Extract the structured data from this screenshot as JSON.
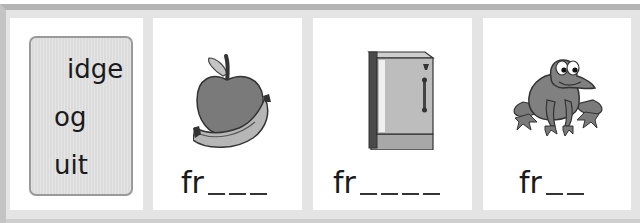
{
  "word_endings": {
    "items": [
      "idge",
      "og",
      "uit"
    ]
  },
  "cards": [
    {
      "picture": "apple-and-banana",
      "stem": "fr",
      "blanks": 3
    },
    {
      "picture": "refrigerator",
      "stem": "fr",
      "blanks": 4
    },
    {
      "picture": "frog",
      "stem": "fr",
      "blanks": 2
    }
  ],
  "colors": {
    "frame": "#e4e4e4",
    "frame_edge": "#b4b4b4",
    "panel": "#ffffff",
    "word_box": "#dcdcdc",
    "illustration_dark": "#6e6e6e",
    "illustration_light": "#b8b8b8"
  }
}
